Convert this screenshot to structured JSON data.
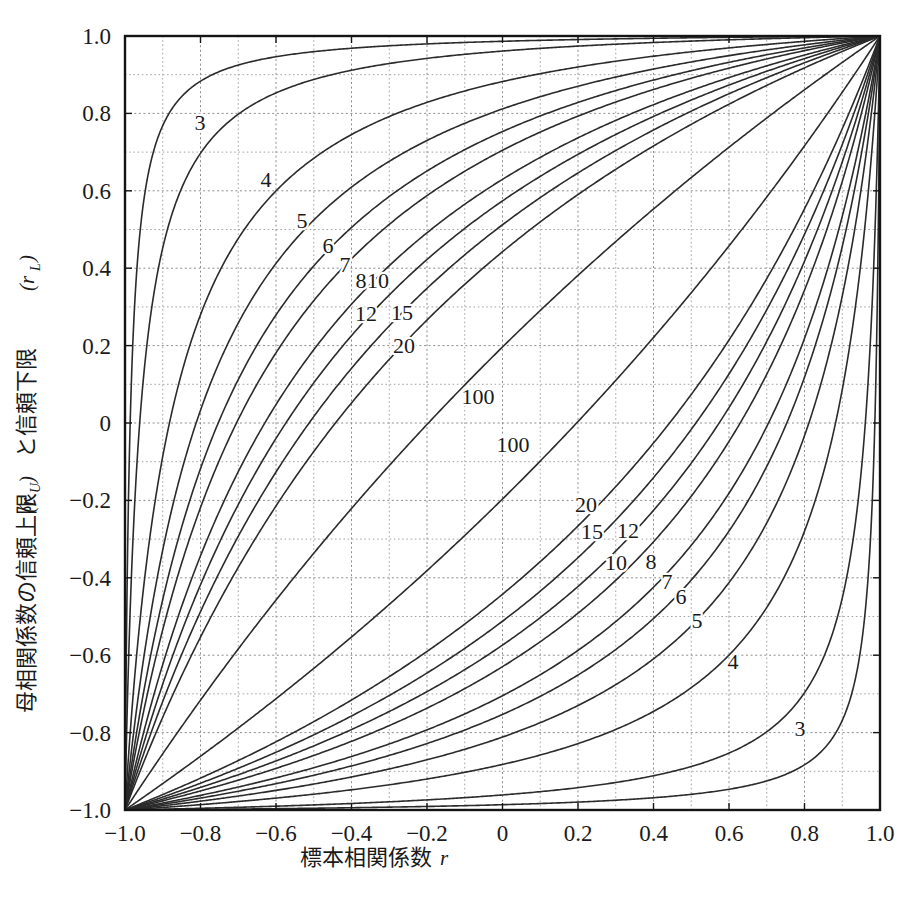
{
  "chart_data": {
    "type": "line",
    "title": "",
    "xlabel": "標本相関係数 r",
    "xlabel_main": "標本相関係数",
    "xlabel_var": "r",
    "ylabel": "母相関係数の信頼上限 (rU) と信頼下限 (rL)",
    "ylabel_part1": "母相関係数の信頼上限",
    "ylabel_var1": "(r",
    "ylabel_sub1": "U",
    "ylabel_close1": ")",
    "ylabel_part2": "と信頼下限",
    "ylabel_var2": "(r",
    "ylabel_sub2": "L",
    "ylabel_close2": ")",
    "xlim": [
      -1.0,
      1.0
    ],
    "ylim": [
      -1.0,
      1.0
    ],
    "xticks": [
      -1.0,
      -0.8,
      -0.6,
      -0.4,
      -0.2,
      0,
      0.2,
      0.4,
      0.6,
      0.8,
      1.0
    ],
    "xtick_labels": [
      "-1.0",
      "-0.8",
      "-0.6",
      "-0.4",
      "-0.2",
      "0",
      "0.2",
      "0.4",
      "0.6",
      "0.8",
      "1.0"
    ],
    "yticks": [
      1.0,
      0.8,
      0.6,
      0.4,
      0.2,
      0,
      -0.2,
      -0.4,
      -0.6,
      -0.8,
      -1.0
    ],
    "ytick_labels": [
      "1.0",
      "0.8",
      "0.6",
      "0.4",
      "0.2",
      "0",
      "-0.2",
      "-0.4",
      "-0.6",
      "-0.8",
      "-1.0"
    ],
    "grid": true,
    "grid_minor_step": 0.1,
    "grid_major_step": 0.2,
    "legend": "none",
    "confidence_level": 0.95,
    "sample_sizes": [
      3,
      4,
      5,
      6,
      7,
      8,
      10,
      12,
      15,
      20,
      100
    ],
    "series": [
      {
        "name": "3-upper",
        "n": 3,
        "branch": "upper"
      },
      {
        "name": "4-upper",
        "n": 4,
        "branch": "upper"
      },
      {
        "name": "5-upper",
        "n": 5,
        "branch": "upper"
      },
      {
        "name": "6-upper",
        "n": 6,
        "branch": "upper"
      },
      {
        "name": "7-upper",
        "n": 7,
        "branch": "upper"
      },
      {
        "name": "8-upper",
        "n": 8,
        "branch": "upper"
      },
      {
        "name": "10-upper",
        "n": 10,
        "branch": "upper"
      },
      {
        "name": "12-upper",
        "n": 12,
        "branch": "upper"
      },
      {
        "name": "15-upper",
        "n": 15,
        "branch": "upper"
      },
      {
        "name": "20-upper",
        "n": 20,
        "branch": "upper"
      },
      {
        "name": "100-upper",
        "n": 100,
        "branch": "upper"
      },
      {
        "name": "100-lower",
        "n": 100,
        "branch": "lower"
      },
      {
        "name": "20-lower",
        "n": 20,
        "branch": "lower"
      },
      {
        "name": "15-lower",
        "n": 15,
        "branch": "lower"
      },
      {
        "name": "12-lower",
        "n": 12,
        "branch": "lower"
      },
      {
        "name": "10-lower",
        "n": 10,
        "branch": "lower"
      },
      {
        "name": "8-lower",
        "n": 8,
        "branch": "lower"
      },
      {
        "name": "7-lower",
        "n": 7,
        "branch": "lower"
      },
      {
        "name": "6-lower",
        "n": 6,
        "branch": "lower"
      },
      {
        "name": "5-lower",
        "n": 5,
        "branch": "lower"
      },
      {
        "name": "4-lower",
        "n": 4,
        "branch": "lower"
      },
      {
        "name": "3-lower",
        "n": 3,
        "branch": "lower"
      }
    ],
    "annotations": [
      {
        "text": "3",
        "x": 200,
        "y": 130
      },
      {
        "text": "4",
        "x": 266,
        "y": 187
      },
      {
        "text": "5",
        "x": 302,
        "y": 228
      },
      {
        "text": "6",
        "x": 328,
        "y": 253
      },
      {
        "text": "7",
        "x": 345,
        "y": 272
      },
      {
        "text": "8",
        "x": 361,
        "y": 288
      },
      {
        "text": "10",
        "x": 378,
        "y": 288
      },
      {
        "text": "12",
        "x": 366,
        "y": 321
      },
      {
        "text": "15",
        "x": 402,
        "y": 320
      },
      {
        "text": "20",
        "x": 404,
        "y": 353
      },
      {
        "text": "100",
        "x": 478,
        "y": 404
      },
      {
        "text": "100",
        "x": 513,
        "y": 452
      },
      {
        "text": "20",
        "x": 586,
        "y": 512
      },
      {
        "text": "15",
        "x": 592,
        "y": 539
      },
      {
        "text": "12",
        "x": 628,
        "y": 538
      },
      {
        "text": "10",
        "x": 616,
        "y": 570
      },
      {
        "text": "8",
        "x": 651,
        "y": 569
      },
      {
        "text": "7",
        "x": 667,
        "y": 589
      },
      {
        "text": "6",
        "x": 681,
        "y": 604
      },
      {
        "text": "5",
        "x": 697,
        "y": 628
      },
      {
        "text": "4",
        "x": 733,
        "y": 669
      },
      {
        "text": "3",
        "x": 800,
        "y": 736
      }
    ],
    "colors": {
      "curve": "#2b2b2b",
      "grid": "#9a9a9a",
      "frame": "#141414",
      "background": "#ffffff",
      "text": "#1a1a1a"
    }
  },
  "figure": {
    "plot_left": 125,
    "plot_top": 36,
    "plot_right": 880,
    "plot_bottom": 810
  }
}
